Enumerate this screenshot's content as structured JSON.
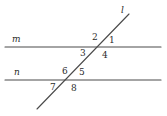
{
  "figure": {
    "stroke_color": "#4a4a4a",
    "label_color": "#2b2b2b",
    "background": "#ffffff"
  },
  "lines": {
    "m": {
      "label": "m",
      "label_x": 12,
      "label_y": 35,
      "x1": 5,
      "y1": 47,
      "x2": 161,
      "y2": 47
    },
    "n": {
      "label": "n",
      "label_x": 14,
      "label_y": 68,
      "x1": 5,
      "y1": 80,
      "x2": 161,
      "y2": 80
    },
    "l": {
      "label": "l",
      "label_x": 121,
      "label_y": 6,
      "x1": 37,
      "y1": 109,
      "x2": 129,
      "y2": 14
    }
  },
  "intersections": {
    "upper": {
      "x": 100,
      "y": 47
    },
    "lower": {
      "x": 70,
      "y": 80
    }
  },
  "angles": [
    {
      "id": "angle-1",
      "label": "1",
      "x": 109,
      "y": 36,
      "at": "upper",
      "position": "upper-right"
    },
    {
      "id": "angle-2",
      "label": "2",
      "x": 92,
      "y": 33,
      "at": "upper",
      "position": "upper-left"
    },
    {
      "id": "angle-3",
      "label": "3",
      "x": 80,
      "y": 49,
      "at": "upper",
      "position": "lower-left"
    },
    {
      "id": "angle-4",
      "label": "4",
      "x": 102,
      "y": 51,
      "at": "upper",
      "position": "lower-right"
    },
    {
      "id": "angle-5",
      "label": "5",
      "x": 79,
      "y": 68,
      "at": "lower",
      "position": "upper-right"
    },
    {
      "id": "angle-6",
      "label": "6",
      "x": 62,
      "y": 67,
      "at": "lower",
      "position": "upper-left"
    },
    {
      "id": "angle-7",
      "label": "7",
      "x": 50,
      "y": 83,
      "at": "lower",
      "position": "lower-left"
    },
    {
      "id": "angle-8",
      "label": "8",
      "x": 71,
      "y": 84,
      "at": "lower",
      "position": "lower-right"
    }
  ]
}
